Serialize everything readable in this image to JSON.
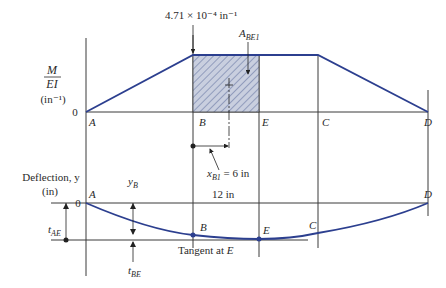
{
  "upper_plot": {
    "y_axis_label_num": "M",
    "y_axis_label_den": "EI",
    "y_axis_unit": "(in⁻¹)",
    "zero_label": "0",
    "peak_value_label": "4.71 × 10⁻⁴ in⁻¹",
    "area_label": "A",
    "area_label_sub": "BE1",
    "centroid_label": "x",
    "centroid_label_sub": "B1",
    "centroid_value": " = 6 in",
    "points": [
      "A",
      "B",
      "E",
      "C",
      "D"
    ]
  },
  "lower_plot": {
    "y_axis_label": "Deflection, y",
    "y_axis_unit": "(in)",
    "zero_label": "0",
    "span_label": "12 in",
    "yB_label": "y",
    "yB_sub": "B",
    "tAE_label": "t",
    "tAE_sub": "AE",
    "tBE_label": "t",
    "tBE_sub": "BE",
    "tangent_label": "Tangent at ",
    "tangent_point": "E",
    "points": [
      "A",
      "B",
      "E",
      "C",
      "D"
    ]
  },
  "colors": {
    "curve": "#2c3f8f",
    "hatch_fill": "#c9cfdf",
    "hatch_line": "#5a6a9a",
    "axis": "#3a3a3a"
  }
}
